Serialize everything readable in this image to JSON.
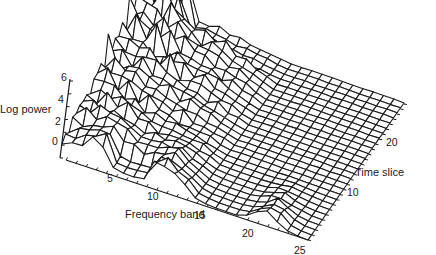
{
  "chart_data": {
    "type": "surface3d",
    "title": "",
    "zlabel": "Log power",
    "xlabel": "Frequency band",
    "ylabel": "Time slice",
    "z_ticks": [
      "0",
      "2",
      "4",
      "6"
    ],
    "x_ticks": [
      "5",
      "10",
      "15",
      "20",
      "25"
    ],
    "y_ticks": [
      "10",
      "20"
    ],
    "zlim": [
      0,
      6
    ],
    "xlim": [
      1,
      25
    ],
    "ylim": [
      1,
      28
    ],
    "grid": false,
    "line_color": "#1a1a1a",
    "surface_color": "#ffffff"
  },
  "labels": {
    "zlabel": "Log power",
    "xlabel": "Frequency band",
    "ylabel": "Time slice"
  }
}
